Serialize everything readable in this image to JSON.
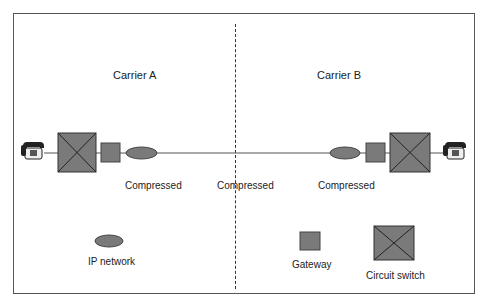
{
  "diagram": {
    "carriers": [
      {
        "label": "Carrier A"
      },
      {
        "label": "Carrier B"
      }
    ],
    "link_labels": [
      "Compressed",
      "Compressed",
      "Compressed"
    ],
    "legend": {
      "ip_network": "IP network",
      "gateway": "Gateway",
      "circuit_switch": "Circuit switch"
    },
    "colors": {
      "node_fill": "#7a7a7a",
      "node_stroke": "#333333",
      "line": "#555555",
      "border": "#555555"
    }
  }
}
